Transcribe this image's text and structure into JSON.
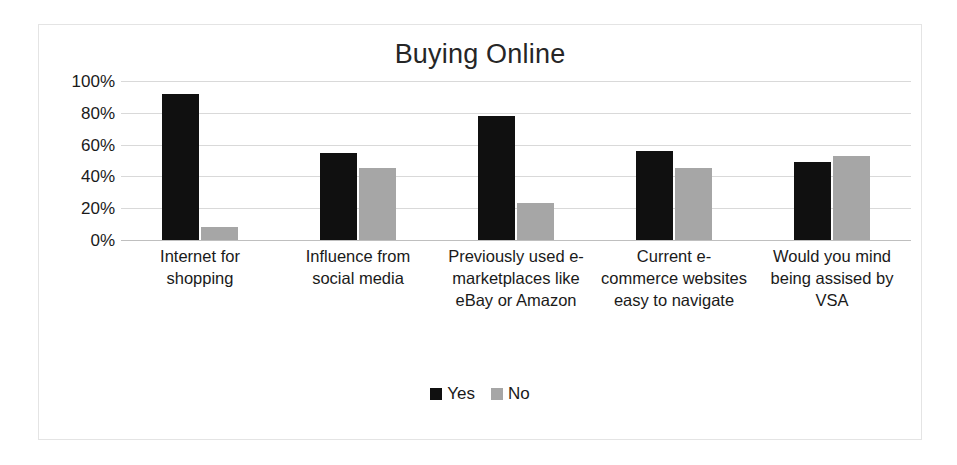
{
  "chart_data": {
    "type": "bar",
    "title": "Buying Online",
    "xlabel": "",
    "ylabel": "",
    "ylim": [
      0,
      100
    ],
    "ytick_labels": [
      "100%",
      "80%",
      "60%",
      "40%",
      "20%",
      "0%"
    ],
    "ytick_values": [
      100,
      80,
      60,
      40,
      20,
      0
    ],
    "grid": true,
    "legend_position": "bottom",
    "categories": [
      "Internet for shopping",
      "Influence from social media",
      "Previously used e-marketplaces like eBay or Amazon",
      "Current e-commerce websites easy to navigate",
      "Would you mind being assised by VSA"
    ],
    "series": [
      {
        "name": "Yes",
        "color": "#101010",
        "values": [
          92,
          55,
          78,
          56,
          49
        ]
      },
      {
        "name": "No",
        "color": "#a6a6a6",
        "values": [
          8,
          45,
          23,
          45,
          53
        ]
      }
    ]
  },
  "legend": {
    "items": [
      {
        "label": "Yes",
        "color": "#101010"
      },
      {
        "label": "No",
        "color": "#a6a6a6"
      }
    ]
  },
  "colors": {
    "yes": "#101010",
    "no": "#a6a6a6",
    "gridline": "#d9d9d9",
    "border": "#e4e4e4",
    "text": "#1a1a1a"
  }
}
